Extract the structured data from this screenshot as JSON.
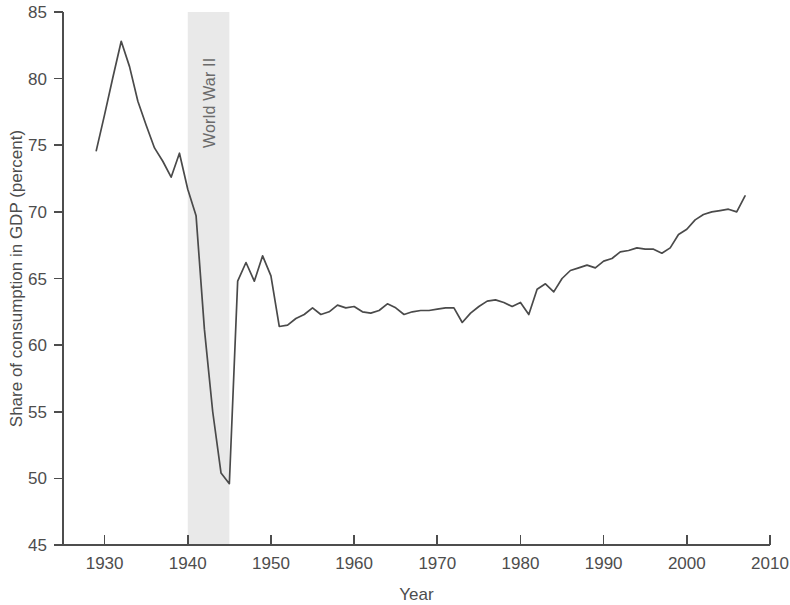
{
  "chart_data": {
    "type": "line",
    "title": "",
    "xlabel": "Year",
    "ylabel": "Share of consumption in GDP (percent)",
    "xlim": [
      1925,
      2010
    ],
    "ylim": [
      45,
      85
    ],
    "xticks": [
      1930,
      1940,
      1950,
      1960,
      1970,
      1980,
      1990,
      2000,
      2010
    ],
    "yticks": [
      45,
      50,
      55,
      60,
      65,
      70,
      75,
      80,
      85
    ],
    "grid": false,
    "legend": null,
    "line_color": "#4a4a4a",
    "annotations": [
      {
        "type": "vspan",
        "label": "World War II",
        "x_start": 1940,
        "x_end": 1945,
        "color": "#e9e9e9",
        "label_rotation": -90
      }
    ],
    "x": [
      1929,
      1930,
      1931,
      1932,
      1933,
      1934,
      1935,
      1936,
      1937,
      1938,
      1939,
      1940,
      1941,
      1942,
      1943,
      1944,
      1945,
      1946,
      1947,
      1948,
      1949,
      1950,
      1951,
      1952,
      1953,
      1954,
      1955,
      1956,
      1957,
      1958,
      1959,
      1960,
      1961,
      1962,
      1963,
      1964,
      1965,
      1966,
      1967,
      1968,
      1969,
      1970,
      1971,
      1972,
      1973,
      1974,
      1975,
      1976,
      1977,
      1978,
      1979,
      1980,
      1981,
      1982,
      1983,
      1984,
      1985,
      1986,
      1987,
      1988,
      1989,
      1990,
      1991,
      1992,
      1993,
      1994,
      1995,
      1996,
      1997,
      1998,
      1999,
      2000,
      2001,
      2002,
      2003,
      2004,
      2005,
      2006,
      2007
    ],
    "values": [
      74.6,
      77.3,
      80.1,
      82.8,
      80.9,
      78.3,
      76.5,
      74.8,
      73.8,
      72.6,
      74.4,
      71.7,
      69.7,
      61.2,
      55.0,
      50.4,
      49.6,
      64.8,
      66.2,
      64.8,
      66.7,
      65.2,
      61.4,
      61.5,
      62.0,
      62.3,
      62.8,
      62.3,
      62.5,
      63.0,
      62.8,
      62.9,
      62.5,
      62.4,
      62.6,
      63.1,
      62.8,
      62.3,
      62.5,
      62.6,
      62.6,
      62.7,
      62.8,
      62.8,
      61.7,
      62.4,
      62.9,
      63.3,
      63.4,
      63.2,
      62.9,
      63.2,
      62.3,
      64.2,
      64.6,
      64.0,
      65.0,
      65.6,
      65.8,
      66.0,
      65.8,
      66.3,
      66.5,
      67.0,
      67.1,
      67.3,
      67.2,
      67.2,
      66.9,
      67.3,
      68.3,
      68.7,
      69.4,
      69.8,
      70.0,
      70.1,
      70.2,
      70.0,
      71.2
    ]
  },
  "axes": {
    "y_axis_title": "Share of consumption in GDP (percent)",
    "x_axis_title": "Year",
    "y_tick_labels": [
      "85",
      "80",
      "75",
      "70",
      "65",
      "60",
      "55",
      "50",
      "45"
    ],
    "x_tick_labels": [
      "1930",
      "1940",
      "1950",
      "1960",
      "1970",
      "1980",
      "1990",
      "2000",
      "2010"
    ]
  },
  "band": {
    "label": "World War II"
  },
  "colors": {
    "line": "#4a4a4a",
    "axis": "#4d4d4d",
    "band": "#e9e9e9",
    "text": "#4d4d4d",
    "band_text": "#6b6b6b",
    "background": "#ffffff"
  }
}
